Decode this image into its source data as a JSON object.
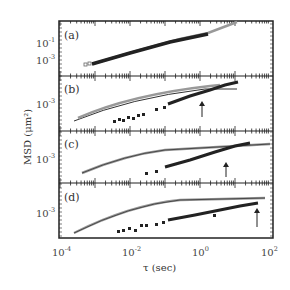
{
  "chart_data": {
    "type": "scatter",
    "title": "",
    "xlabel": "τ (sec)",
    "ylabel": "MSD (μm²)",
    "xscale": "log",
    "yscale": "log",
    "xlim": [
      0.0001,
      150
    ],
    "x_ticks": [
      "10^-4",
      "10^-2",
      "10^0",
      "10^2"
    ],
    "grid": false,
    "legend": null,
    "panels": [
      {
        "label": "(a)",
        "y_ticks": [
          "10^-1",
          "10^-3"
        ],
        "series": [
          {
            "name": "open squares",
            "marker": "open-square",
            "x": [
              0.0002,
              0.001,
              0.01,
              0.1,
              1,
              10,
              50
            ],
            "y": [
              0.0005,
              0.0012,
              0.004,
              0.013,
              0.04,
              0.13,
              0.3
            ]
          },
          {
            "name": "filled squares",
            "marker": "filled-square",
            "x": [
              0.0003,
              0.001,
              0.01,
              0.1,
              1,
              5
            ],
            "y": [
              0.0006,
              0.0012,
              0.004,
              0.013,
              0.04,
              0.09
            ]
          }
        ],
        "arrow_x": null
      },
      {
        "label": "(b)",
        "y_ticks": [
          "10^-3"
        ],
        "series": [
          {
            "name": "open squares",
            "marker": "open-square",
            "x": [
              0.0004,
              0.003,
              0.03,
              0.3,
              3,
              30
            ],
            "y": [
              0.0002,
              0.0006,
              0.0015,
              0.003,
              0.004,
              0.004
            ]
          },
          {
            "name": "filled squares",
            "marker": "filled-square",
            "x": [
              0.005,
              0.03,
              0.2,
              1,
              5,
              50
            ],
            "y": [
              0.0002,
              0.0004,
              0.0008,
              0.0018,
              0.003,
              0.005
            ]
          },
          {
            "name": "fit line",
            "marker": "line",
            "x": [
              0.0004,
              0.01,
              1,
              50
            ],
            "y": [
              0.0002,
              0.001,
              0.003,
              0.0032
            ]
          }
        ],
        "arrow_x": 2
      },
      {
        "label": "(c)",
        "y_ticks": [
          "10^-3"
        ],
        "series": [
          {
            "name": "open squares",
            "marker": "open-square",
            "x": [
              0.001,
              0.01,
              0.1,
              1,
              10,
              100
            ],
            "y": [
              0.0002,
              0.0008,
              0.002,
              0.003,
              0.0035,
              0.0035
            ]
          },
          {
            "name": "filled squares",
            "marker": "filled-square",
            "x": [
              0.01,
              0.1,
              1,
              10,
              50
            ],
            "y": [
              0.0002,
              0.0005,
              0.0012,
              0.003,
              0.004
            ]
          }
        ],
        "arrow_x": 10
      },
      {
        "label": "(d)",
        "y_ticks": [
          "10^-3"
        ],
        "series": [
          {
            "name": "open squares",
            "marker": "open-square",
            "x": [
              0.0004,
              0.003,
              0.03,
              0.3,
              3,
              80
            ],
            "y": [
              0.0002,
              0.0006,
              0.0018,
              0.003,
              0.0032,
              0.0032
            ]
          },
          {
            "name": "filled squares",
            "marker": "filled-square",
            "x": [
              0.005,
              0.03,
              0.3,
              3,
              30,
              80
            ],
            "y": [
              0.0002,
              0.0004,
              0.0008,
              0.0013,
              0.002,
              0.0025
            ]
          }
        ],
        "arrow_x": 60
      }
    ]
  },
  "axes": {
    "xlabel": "τ (sec)",
    "ylabel": "MSD (μm²)",
    "x_tick_labels": [
      {
        "base": "10",
        "exp": "-4"
      },
      {
        "base": "10",
        "exp": "-2"
      },
      {
        "base": "10",
        "exp": "0"
      },
      {
        "base": "10",
        "exp": "2"
      }
    ]
  },
  "panels": [
    {
      "label": "(a)",
      "yticks": [
        {
          "base": "10",
          "exp": "-1"
        },
        {
          "base": "10",
          "exp": "-3"
        }
      ]
    },
    {
      "label": "(b)",
      "yticks": [
        {
          "base": "10",
          "exp": "-3"
        }
      ]
    },
    {
      "label": "(c)",
      "yticks": [
        {
          "base": "10",
          "exp": "-3"
        }
      ]
    },
    {
      "label": "(d)",
      "yticks": [
        {
          "base": "10",
          "exp": "-3"
        }
      ]
    }
  ]
}
